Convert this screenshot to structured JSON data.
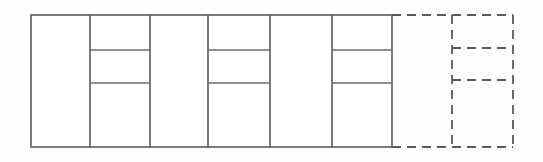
{
  "diagram": {
    "type": "elevation-grid",
    "canvas": {
      "width": 543,
      "height": 162,
      "background": "#fefefe"
    },
    "styles": {
      "solid_line_color": "#5a5a5a",
      "dashed_line_color": "#5a5a5a",
      "solid_line_width": 1.6,
      "dashed_line_width": 1.8,
      "dash_pattern": "9 6",
      "panel_fill": "#ffffff"
    },
    "solid_block": {
      "label": "built-bays",
      "x_left": 31,
      "x_right": 392,
      "y_top": 15,
      "y_bottom": 147,
      "bay_edges": [
        31,
        90,
        150,
        208,
        270,
        332,
        392
      ],
      "bay_count": 6,
      "subdivided_bays": [
        2,
        4,
        6
      ],
      "subdivision_y": [
        50,
        83
      ]
    },
    "dashed_block": {
      "label": "future-expansion-bays",
      "x_left": 392,
      "x_right": 513,
      "y_top": 15,
      "y_bottom": 147,
      "bay_edges": [
        392,
        452,
        513
      ],
      "bay_count": 2,
      "subdivided_bays": [
        2
      ],
      "subdivision_y": [
        48,
        80
      ]
    },
    "bays": [
      {
        "index": 1,
        "x0": 31,
        "x1": 90,
        "style": "solid",
        "subdivided": false,
        "panels": 1
      },
      {
        "index": 2,
        "x0": 90,
        "x1": 150,
        "style": "solid",
        "subdivided": true,
        "panels": 3
      },
      {
        "index": 3,
        "x0": 150,
        "x1": 208,
        "style": "solid",
        "subdivided": false,
        "panels": 1
      },
      {
        "index": 4,
        "x0": 208,
        "x1": 270,
        "style": "solid",
        "subdivided": true,
        "panels": 3
      },
      {
        "index": 5,
        "x0": 270,
        "x1": 332,
        "style": "solid",
        "subdivided": false,
        "panels": 1
      },
      {
        "index": 6,
        "x0": 332,
        "x1": 392,
        "style": "solid",
        "subdivided": true,
        "panels": 3
      },
      {
        "index": 7,
        "x0": 392,
        "x1": 452,
        "style": "dashed",
        "subdivided": false,
        "panels": 1
      },
      {
        "index": 8,
        "x0": 452,
        "x1": 513,
        "style": "dashed",
        "subdivided": true,
        "panels": 3
      }
    ]
  }
}
